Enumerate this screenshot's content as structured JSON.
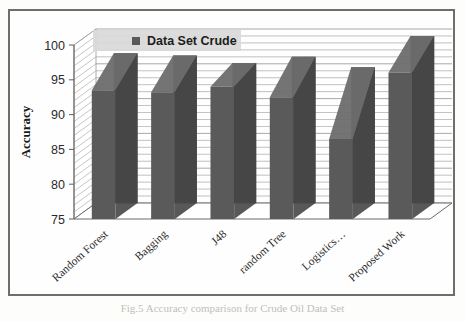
{
  "figure": {
    "caption": "Fig.5 Accuracy comparison for Crude Oil Data Set"
  },
  "legend": {
    "entries": [
      {
        "label": "Data Set Crude",
        "color": "#5a5a5a",
        "marker": "legend-swatch-icon"
      }
    ],
    "position": "top-center"
  },
  "chart_data": {
    "type": "bar",
    "title": "",
    "subtitle": "",
    "xlabel": "",
    "ylabel": "Accuracy",
    "ylim": [
      75,
      100
    ],
    "ytick_step": 5,
    "minor_gridline_step": 1,
    "grid": true,
    "three_d": true,
    "categories": [
      "Random Forest",
      "Bagging",
      "J48",
      "random Tree",
      "Logistics…",
      "Proposed Work"
    ],
    "ytick_labels": [
      "75",
      "80",
      "85",
      "90",
      "95",
      "100"
    ],
    "series": [
      {
        "name": "Data Set Crude",
        "color": "#5a5a5a",
        "top_color": "#6d6d6d",
        "side_color": "#464646",
        "values": [
          93.5,
          93.2,
          94.0,
          92.5,
          86.5,
          96.0
        ],
        "back_values": [
          96.5,
          96.2,
          95.1,
          96.0,
          94.5,
          99.0
        ]
      }
    ],
    "annotations": []
  },
  "colors": {
    "frame_border": "#6e6e6e",
    "plot_background": "#fefefe",
    "gridline": "#9b9b9b",
    "axis_line": "#6b6b6b",
    "legend_background": "#d9d9d9",
    "bar_fill": "#5a5a5a",
    "page_background": "#fdfdfb"
  }
}
